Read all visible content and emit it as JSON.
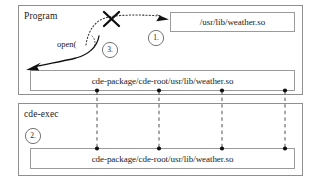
{
  "diagram": {
    "containers": [
      {
        "id": "program",
        "label": "Program"
      },
      {
        "id": "cde-exec",
        "label": "cde-exec"
      }
    ],
    "boxes": [
      {
        "id": "original-path-box",
        "path": "/usr/lib/weather.so"
      },
      {
        "id": "program-redirect-box",
        "path": "cde-package/cde-root/usr/lib/weather.so"
      },
      {
        "id": "cdeexec-path-box",
        "path": "cde-package/cde-root/usr/lib/weather.so"
      }
    ],
    "annotations": {
      "syscall_label": "open(",
      "steps": [
        {
          "id": "step-1",
          "label": "1."
        },
        {
          "id": "step-2",
          "label": "2."
        },
        {
          "id": "step-3",
          "label": "3."
        }
      ],
      "blocked_marker": "X"
    },
    "colors": {
      "stroke": "#4a4a4a",
      "box_stroke": "#8a8a8a",
      "ink": "#1a1a1a",
      "dot": "#111111",
      "background": "#ffffff"
    }
  }
}
